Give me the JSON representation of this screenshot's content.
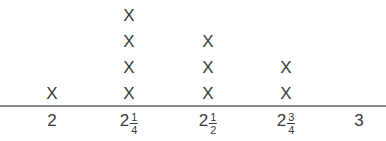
{
  "chart_data": {
    "type": "dot_plot",
    "title": "",
    "xlabel": "",
    "ylabel": "",
    "marker": "X",
    "categories": [
      "2",
      "2 1/4",
      "2 1/2",
      "2 3/4",
      "3"
    ],
    "values": [
      1,
      4,
      3,
      2,
      0
    ],
    "xlim": [
      2,
      3
    ]
  },
  "ticks": [
    {
      "whole": "2",
      "num": "",
      "den": ""
    },
    {
      "whole": "2",
      "num": "1",
      "den": "4"
    },
    {
      "whole": "2",
      "num": "1",
      "den": "2"
    },
    {
      "whole": "2",
      "num": "3",
      "den": "4"
    },
    {
      "whole": "3",
      "num": "",
      "den": ""
    }
  ],
  "marker_label": "X"
}
